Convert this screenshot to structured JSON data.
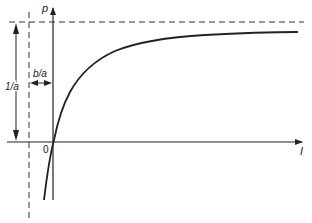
{
  "diagram": {
    "type": "saturation-curve",
    "axes": {
      "y_label": "p",
      "x_label": "I",
      "origin_label": "0"
    },
    "annotations": {
      "asymptote_height_label": "1/a",
      "asymptote_offset_label": "b/a"
    },
    "curve_description": "Hyperbolic curve p = I/(aI + b), passing through origin and approaching horizontal asymptote p = 1/a; vertical asymptote at I = -b/a",
    "colors": {
      "line": "#222222",
      "background": "#ffffff"
    }
  }
}
